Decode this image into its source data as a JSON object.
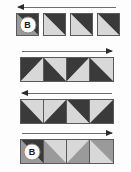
{
  "diagram": {
    "colors": {
      "dark": "#3a3a3a",
      "light": "#d8d8d8",
      "mid": "#9a9a9a",
      "border": "#5a5a5a",
      "background": "#fdfdfd",
      "arrow": "#2b2b2b"
    },
    "badge_label": "B",
    "rows": [
      {
        "id": "row-1",
        "arrow_direction": "left",
        "spaced": true,
        "tiles": [
          {
            "split": "tr-bl",
            "upper": "dark",
            "lower": "mid",
            "badge": "B"
          },
          {
            "split": "tr-bl",
            "upper": "dark",
            "lower": "light",
            "badge": ""
          },
          {
            "split": "tr-bl",
            "upper": "dark",
            "lower": "light",
            "badge": ""
          },
          {
            "split": "tr-bl",
            "upper": "dark",
            "lower": "light",
            "badge": ""
          }
        ]
      },
      {
        "id": "row-2",
        "arrow_direction": "right",
        "spaced": false,
        "tiles": [
          {
            "split": "tl-br",
            "upper": "dark",
            "lower": "light",
            "badge": ""
          },
          {
            "split": "tr-bl",
            "upper": "light",
            "lower": "dark",
            "badge": ""
          },
          {
            "split": "tl-br",
            "upper": "dark",
            "lower": "light",
            "badge": ""
          },
          {
            "split": "tr-bl",
            "upper": "light",
            "lower": "dark",
            "badge": ""
          }
        ]
      },
      {
        "id": "row-3",
        "arrow_direction": "left",
        "spaced": false,
        "tiles": [
          {
            "split": "tr-bl",
            "upper": "light",
            "lower": "dark",
            "badge": ""
          },
          {
            "split": "tl-br",
            "upper": "light",
            "lower": "dark",
            "badge": ""
          },
          {
            "split": "tr-bl",
            "upper": "dark",
            "lower": "light",
            "badge": ""
          },
          {
            "split": "tl-br",
            "upper": "light",
            "lower": "dark",
            "badge": ""
          }
        ]
      },
      {
        "id": "row-4",
        "arrow_direction": "right",
        "spaced": false,
        "tiles": [
          {
            "split": "tr-bl",
            "upper": "dark",
            "lower": "mid",
            "badge": "B"
          },
          {
            "split": "tr-bl",
            "upper": "light",
            "lower": "mid",
            "badge": ""
          },
          {
            "split": "tl-br",
            "upper": "light",
            "lower": "mid",
            "badge": ""
          },
          {
            "split": "tr-bl",
            "upper": "mid",
            "lower": "light",
            "badge": ""
          }
        ]
      }
    ]
  }
}
